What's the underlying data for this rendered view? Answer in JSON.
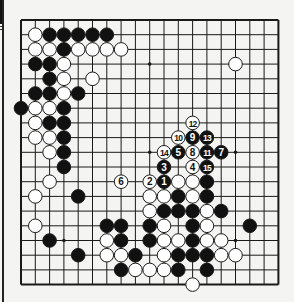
{
  "diagram": {
    "type": "go-board",
    "size": 19,
    "colors": {
      "background": "#f4f4f2",
      "line": "#1a1a1a",
      "black": "#111111",
      "white": "#ffffff"
    },
    "geometry": {
      "x0": 21,
      "y0": 20,
      "dx": 14.3,
      "dy": 14.7,
      "stone_r": 6.8
    },
    "star_points": [
      [
        3,
        3
      ],
      [
        9,
        3
      ],
      [
        15,
        3
      ],
      [
        3,
        9
      ],
      [
        9,
        9
      ],
      [
        15,
        9
      ],
      [
        3,
        15
      ],
      [
        9,
        15
      ],
      [
        15,
        15
      ]
    ],
    "stones": [
      {
        "c": 1,
        "r": 1,
        "color": "W"
      },
      {
        "c": 2,
        "r": 1,
        "color": "B"
      },
      {
        "c": 3,
        "r": 1,
        "color": "B"
      },
      {
        "c": 4,
        "r": 1,
        "color": "B"
      },
      {
        "c": 5,
        "r": 1,
        "color": "B"
      },
      {
        "c": 6,
        "r": 1,
        "color": "B"
      },
      {
        "c": 1,
        "r": 2,
        "color": "W"
      },
      {
        "c": 2,
        "r": 2,
        "color": "W"
      },
      {
        "c": 3,
        "r": 2,
        "color": "B"
      },
      {
        "c": 4,
        "r": 2,
        "color": "W"
      },
      {
        "c": 5,
        "r": 2,
        "color": "W"
      },
      {
        "c": 6,
        "r": 2,
        "color": "W"
      },
      {
        "c": 7,
        "r": 2,
        "color": "W"
      },
      {
        "c": 1,
        "r": 3,
        "color": "B"
      },
      {
        "c": 2,
        "r": 3,
        "color": "B"
      },
      {
        "c": 3,
        "r": 3,
        "color": "W"
      },
      {
        "c": 15,
        "r": 3,
        "color": "W"
      },
      {
        "c": 2,
        "r": 4,
        "color": "B"
      },
      {
        "c": 3,
        "r": 4,
        "color": "W"
      },
      {
        "c": 5,
        "r": 4,
        "color": "W"
      },
      {
        "c": 1,
        "r": 5,
        "color": "B"
      },
      {
        "c": 2,
        "r": 5,
        "color": "B"
      },
      {
        "c": 3,
        "r": 5,
        "color": "W"
      },
      {
        "c": 4,
        "r": 5,
        "color": "B"
      },
      {
        "c": 0,
        "r": 6,
        "color": "B"
      },
      {
        "c": 1,
        "r": 6,
        "color": "W"
      },
      {
        "c": 2,
        "r": 6,
        "color": "W"
      },
      {
        "c": 3,
        "r": 6,
        "color": "B"
      },
      {
        "c": 1,
        "r": 7,
        "color": "W"
      },
      {
        "c": 2,
        "r": 7,
        "color": "B"
      },
      {
        "c": 3,
        "r": 7,
        "color": "B"
      },
      {
        "c": 12,
        "r": 7,
        "color": "W",
        "label": "12"
      },
      {
        "c": 1,
        "r": 8,
        "color": "W"
      },
      {
        "c": 2,
        "r": 8,
        "color": "W"
      },
      {
        "c": 3,
        "r": 8,
        "color": "B"
      },
      {
        "c": 11,
        "r": 8,
        "color": "W",
        "label": "10"
      },
      {
        "c": 12,
        "r": 8,
        "color": "B",
        "label": "9"
      },
      {
        "c": 13,
        "r": 8,
        "color": "B",
        "label": "13"
      },
      {
        "c": 2,
        "r": 9,
        "color": "W"
      },
      {
        "c": 3,
        "r": 9,
        "color": "B"
      },
      {
        "c": 10,
        "r": 9,
        "color": "W",
        "label": "14"
      },
      {
        "c": 11,
        "r": 9,
        "color": "B",
        "label": "5"
      },
      {
        "c": 12,
        "r": 9,
        "color": "W",
        "label": "8"
      },
      {
        "c": 13,
        "r": 9,
        "color": "B",
        "label": "11"
      },
      {
        "c": 14,
        "r": 9,
        "color": "B",
        "label": "7"
      },
      {
        "c": 3,
        "r": 10,
        "color": "B"
      },
      {
        "c": 10,
        "r": 10,
        "color": "B",
        "label": "3"
      },
      {
        "c": 12,
        "r": 10,
        "color": "W",
        "label": "4"
      },
      {
        "c": 13,
        "r": 10,
        "color": "B",
        "label": "15"
      },
      {
        "c": 2,
        "r": 11,
        "color": "W"
      },
      {
        "c": 7,
        "r": 11,
        "color": "W",
        "label": "6"
      },
      {
        "c": 9,
        "r": 11,
        "color": "W",
        "label": "2"
      },
      {
        "c": 10,
        "r": 11,
        "color": "B",
        "label": "1"
      },
      {
        "c": 11,
        "r": 11,
        "color": "W"
      },
      {
        "c": 12,
        "r": 11,
        "color": "W"
      },
      {
        "c": 13,
        "r": 11,
        "color": "B"
      },
      {
        "c": 1,
        "r": 12,
        "color": "W"
      },
      {
        "c": 4,
        "r": 12,
        "color": "B"
      },
      {
        "c": 9,
        "r": 12,
        "color": "W"
      },
      {
        "c": 10,
        "r": 12,
        "color": "W"
      },
      {
        "c": 11,
        "r": 12,
        "color": "B"
      },
      {
        "c": 12,
        "r": 12,
        "color": "W"
      },
      {
        "c": 13,
        "r": 12,
        "color": "B"
      },
      {
        "c": 9,
        "r": 13,
        "color": "W"
      },
      {
        "c": 10,
        "r": 13,
        "color": "B"
      },
      {
        "c": 11,
        "r": 13,
        "color": "B"
      },
      {
        "c": 12,
        "r": 13,
        "color": "B"
      },
      {
        "c": 13,
        "r": 13,
        "color": "W"
      },
      {
        "c": 14,
        "r": 13,
        "color": "B"
      },
      {
        "c": 1,
        "r": 14,
        "color": "W"
      },
      {
        "c": 6,
        "r": 14,
        "color": "B"
      },
      {
        "c": 7,
        "r": 14,
        "color": "B"
      },
      {
        "c": 9,
        "r": 14,
        "color": "B"
      },
      {
        "c": 10,
        "r": 14,
        "color": "W"
      },
      {
        "c": 12,
        "r": 14,
        "color": "B"
      },
      {
        "c": 13,
        "r": 14,
        "color": "W"
      },
      {
        "c": 16,
        "r": 14,
        "color": "B"
      },
      {
        "c": 2,
        "r": 15,
        "color": "B"
      },
      {
        "c": 6,
        "r": 15,
        "color": "W"
      },
      {
        "c": 7,
        "r": 15,
        "color": "B"
      },
      {
        "c": 9,
        "r": 15,
        "color": "B"
      },
      {
        "c": 10,
        "r": 15,
        "color": "W"
      },
      {
        "c": 11,
        "r": 15,
        "color": "W"
      },
      {
        "c": 12,
        "r": 15,
        "color": "B"
      },
      {
        "c": 13,
        "r": 15,
        "color": "W"
      },
      {
        "c": 14,
        "r": 15,
        "color": "W"
      },
      {
        "c": 4,
        "r": 16,
        "color": "B"
      },
      {
        "c": 6,
        "r": 16,
        "color": "W"
      },
      {
        "c": 7,
        "r": 16,
        "color": "W"
      },
      {
        "c": 8,
        "r": 16,
        "color": "B"
      },
      {
        "c": 10,
        "r": 16,
        "color": "W"
      },
      {
        "c": 11,
        "r": 16,
        "color": "B"
      },
      {
        "c": 12,
        "r": 16,
        "color": "B"
      },
      {
        "c": 13,
        "r": 16,
        "color": "B"
      },
      {
        "c": 14,
        "r": 16,
        "color": "W"
      },
      {
        "c": 15,
        "r": 16,
        "color": "W"
      },
      {
        "c": 7,
        "r": 17,
        "color": "B"
      },
      {
        "c": 8,
        "r": 17,
        "color": "W"
      },
      {
        "c": 9,
        "r": 17,
        "color": "W"
      },
      {
        "c": 10,
        "r": 17,
        "color": "W"
      },
      {
        "c": 11,
        "r": 17,
        "color": "B"
      },
      {
        "c": 13,
        "r": 17,
        "color": "B"
      },
      {
        "c": 12,
        "r": 18,
        "color": "W"
      }
    ]
  }
}
